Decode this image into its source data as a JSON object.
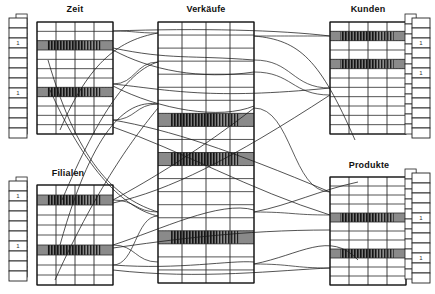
{
  "diagram": {
    "type": "star-schema-index-join",
    "background_color": "#ffffff",
    "line_color": "#1a1a1a",
    "highlight_fill": "#8c8c8c",
    "hatch_color": "#262626"
  },
  "tables": [
    {
      "id": "zeit",
      "label": "Zeit",
      "role": "dimension",
      "x": 37,
      "y": 22,
      "width": 76,
      "height": 112,
      "columns": 4,
      "rows": 12,
      "label_x": 55,
      "label_y": 7,
      "highlighted_rows": [
        2,
        7
      ],
      "index": {
        "side": "left",
        "x": 9,
        "y": 18,
        "cell_width": 18,
        "cell_height": 10,
        "cells": 12,
        "offset_x": 7,
        "offset_y": -4,
        "marked_cells": [
          2,
          7
        ]
      }
    },
    {
      "id": "filialen",
      "label": "Filialen",
      "role": "dimension",
      "x": 37,
      "y": 185,
      "width": 76,
      "height": 100,
      "columns": 4,
      "rows": 10,
      "label_x": 52,
      "label_y": 170,
      "highlighted_rows": [
        1,
        6
      ],
      "index": {
        "side": "left",
        "x": 9,
        "y": 181,
        "cell_width": 18,
        "cell_height": 10,
        "cells": 10,
        "offset_x": 7,
        "offset_y": -4,
        "marked_cells": [
          1,
          6
        ]
      }
    },
    {
      "id": "verkaeufe",
      "label": "Verkäufe",
      "role": "fact",
      "x": 158,
      "y": 22,
      "width": 96,
      "height": 261,
      "columns": 4,
      "rows": 20,
      "label_x": 186,
      "label_y": 7,
      "highlighted_rows": [
        7,
        10,
        16
      ]
    },
    {
      "id": "kunden",
      "label": "Kunden",
      "role": "dimension",
      "x": 330,
      "y": 22,
      "width": 76,
      "height": 112,
      "columns": 4,
      "rows": 12,
      "label_x": 348,
      "label_y": 7,
      "highlighted_rows": [
        1,
        4
      ],
      "index": {
        "side": "right",
        "x": 412,
        "y": 18,
        "cell_width": 18,
        "cell_height": 10,
        "cells": 12,
        "offset_x": -7,
        "offset_y": -4,
        "marked_cells": [
          2,
          5
        ]
      }
    },
    {
      "id": "produkte",
      "label": "Produkte",
      "role": "dimension",
      "x": 330,
      "y": 177,
      "width": 76,
      "height": 108,
      "columns": 4,
      "rows": 12,
      "label_x": 348,
      "label_y": 162,
      "highlighted_rows": [
        4,
        8
      ],
      "index": {
        "side": "right",
        "x": 412,
        "y": 173,
        "cell_width": 18,
        "cell_height": 10,
        "cells": 11,
        "offset_x": -7,
        "offset_y": -4,
        "marked_cells": [
          4,
          8
        ]
      }
    }
  ],
  "join_lines": {
    "count": 22,
    "description": "Gebogene Verbindungslinien zwischen Dimensionstabellen-Zeilen und Faktentabellen-Zeilen",
    "paths": [
      "M113,31 C200,28 280,30 330,36",
      "M113,48 C170,60 190,55 254,60",
      "M113,50 C150,70 200,80 254,72",
      "M113,84 C170,90 210,100 330,88",
      "M113,86 C160,110 220,120 254,106",
      "M113,120 C170,130 230,150 330,192",
      "M113,127 C180,150 250,190 330,215",
      "M113,200 C150,180 200,150 254,108",
      "M113,203 C170,190 230,160 330,95",
      "M113,245 C160,230 220,200 254,210",
      "M113,248 C170,240 240,230 330,230",
      "M113,265 C180,270 230,260 254,262",
      "M113,270 C200,280 280,270 330,268",
      "M158,33 C120,40 90,60 60,130",
      "M158,62 C130,70 100,110 62,200",
      "M158,104 C130,100 95,120 60,245",
      "M158,108 C140,130 100,180 55,280",
      "M158,212 C120,200 80,170 48,60",
      "M158,216 C130,210 90,180 50,90",
      "M254,36 C300,40 320,60 355,140",
      "M254,212 C290,205 320,190 358,182",
      "M254,264 C300,255 330,230 358,260"
    ]
  },
  "legend": {
    "highlighted_row_meaning": "Treffer-Zeile (Bitmap-Index Match)",
    "index_mark_symbol": "1"
  }
}
